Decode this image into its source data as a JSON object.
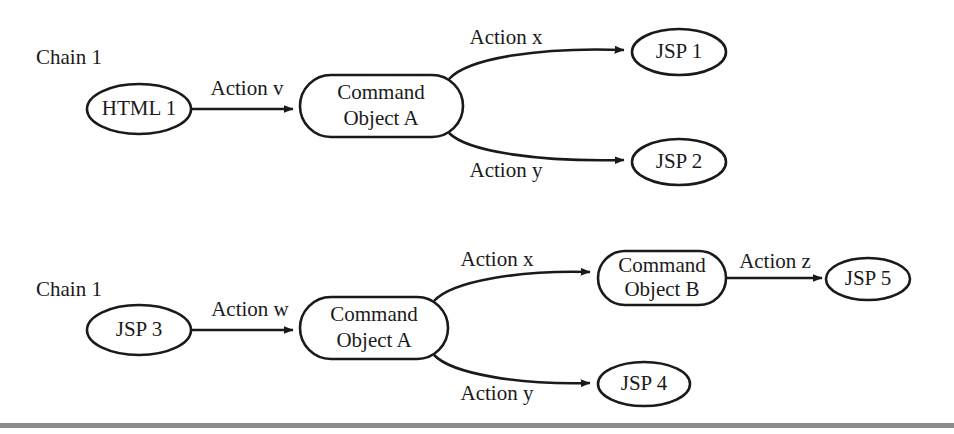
{
  "figure": {
    "background_color": "#ffffff",
    "stroke_color": "#1a1a1a",
    "footer_rule_color": "#8c8c8c",
    "width": 954,
    "height": 434
  },
  "chains": [
    {
      "id": "chain-top",
      "label": "Chain 1",
      "nodes": [
        {
          "id": "html-1",
          "label": "HTML 1",
          "shape": "ellipse"
        },
        {
          "id": "command-object-a-top",
          "label_line1": "Command",
          "label_line2": "Object A",
          "shape": "rounded-rect"
        },
        {
          "id": "jsp-1",
          "label": "JSP 1",
          "shape": "ellipse"
        },
        {
          "id": "jsp-2",
          "label": "JSP 2",
          "shape": "ellipse"
        }
      ],
      "edges": [
        {
          "id": "edge-action-v",
          "label": "Action v",
          "from": "html-1",
          "to": "command-object-a-top",
          "style": "straight"
        },
        {
          "id": "edge-top-action-x",
          "label": "Action x",
          "from": "command-object-a-top",
          "to": "jsp-1",
          "style": "curve-up"
        },
        {
          "id": "edge-top-action-y",
          "label": "Action y",
          "from": "command-object-a-top",
          "to": "jsp-2",
          "style": "curve-down"
        }
      ]
    },
    {
      "id": "chain-bottom",
      "label": "Chain 1",
      "nodes": [
        {
          "id": "jsp-3",
          "label": "JSP 3",
          "shape": "ellipse"
        },
        {
          "id": "command-object-a-bottom",
          "label_line1": "Command",
          "label_line2": "Object A",
          "shape": "rounded-rect"
        },
        {
          "id": "command-object-b",
          "label_line1": "Command",
          "label_line2": "Object B",
          "shape": "rounded-rect"
        },
        {
          "id": "jsp-5",
          "label": "JSP 5",
          "shape": "ellipse"
        },
        {
          "id": "jsp-4",
          "label": "JSP 4",
          "shape": "ellipse"
        }
      ],
      "edges": [
        {
          "id": "edge-action-w",
          "label": "Action w",
          "from": "jsp-3",
          "to": "command-object-a-bottom",
          "style": "straight"
        },
        {
          "id": "edge-bottom-action-x",
          "label": "Action x",
          "from": "command-object-a-bottom",
          "to": "command-object-b",
          "style": "curve-up"
        },
        {
          "id": "edge-bottom-action-y",
          "label": "Action y",
          "from": "command-object-a-bottom",
          "to": "jsp-4",
          "style": "curve-down"
        },
        {
          "id": "edge-action-z",
          "label": "Action z",
          "from": "command-object-b",
          "to": "jsp-5",
          "style": "straight"
        }
      ]
    }
  ],
  "labels": {
    "chain_top": "Chain 1",
    "chain_bottom": "Chain 1",
    "html_1": "HTML 1",
    "action_v": "Action v",
    "cmd_a_top_l1": "Command",
    "cmd_a_top_l2": "Object A",
    "action_x_top": "Action x",
    "action_y_top": "Action y",
    "jsp_1": "JSP 1",
    "jsp_2": "JSP 2",
    "jsp_3": "JSP 3",
    "action_w": "Action w",
    "cmd_a_bottom_l1": "Command",
    "cmd_a_bottom_l2": "Object A",
    "action_x_bottom": "Action x",
    "action_y_bottom": "Action y",
    "cmd_b_l1": "Command",
    "cmd_b_l2": "Object B",
    "action_z": "Action z",
    "jsp_5": "JSP 5",
    "jsp_4": "JSP 4"
  }
}
